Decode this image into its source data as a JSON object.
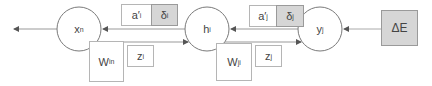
{
  "diagram": {
    "type": "backpropagation-flow",
    "nodes": [
      {
        "id": "xn",
        "label": "x",
        "sub": "n"
      },
      {
        "id": "hi",
        "label": "h",
        "sub": "i"
      },
      {
        "id": "yj",
        "label": "y",
        "sub": "j"
      }
    ],
    "error_box": {
      "label": "ΔE"
    },
    "boxes": {
      "a_i": {
        "label": "a′",
        "sub": "i"
      },
      "delta_i": {
        "label": "δ",
        "sub": "i"
      },
      "a_j": {
        "label": "a′",
        "sub": "j"
      },
      "delta_j": {
        "label": "δ",
        "sub": "j"
      },
      "w_in": {
        "label": "W",
        "sub": "in"
      },
      "z_i": {
        "label": "z",
        "sub": "i"
      },
      "w_ji": {
        "label": "W",
        "sub": "ji"
      },
      "z_j": {
        "label": "z",
        "sub": "j"
      }
    },
    "colors": {
      "line": "#8c8c8c",
      "circle_stroke": "#7a7a7a",
      "shaded_fill": "#d6d6d6",
      "box_border": "#b5b5b5"
    }
  }
}
